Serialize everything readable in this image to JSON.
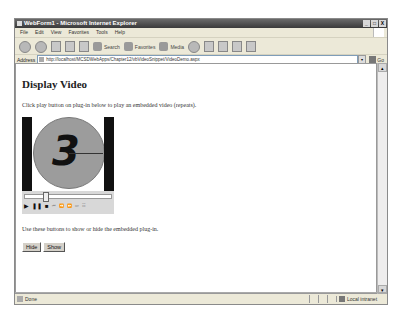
{
  "window": {
    "title": "WebForm1 - Microsoft Internet Explorer",
    "controls": [
      "_",
      "□",
      "X"
    ]
  },
  "menu": [
    "File",
    "Edit",
    "View",
    "Favorites",
    "Tools",
    "Help"
  ],
  "toolbar": {
    "back_label": "Back",
    "search_label": "Search",
    "favorites_label": "Favorites",
    "media_label": "Media"
  },
  "address": {
    "label": "Address",
    "url": "http://localhost/MCSDWebApps/Chapter12/vbVideoSnippet/VideoDemo.aspx",
    "go_label": "Go"
  },
  "page": {
    "heading": "Display Video",
    "intro": "Click play button on plug-in below to play an embedded video (repeats).",
    "video_frame_number": "3",
    "instructions": "Use these buttons to show or hide the embedded plug-in.",
    "buttons": {
      "hide": "Hide",
      "show": "Show"
    }
  },
  "player": {
    "controls": [
      "▶",
      "❚❚",
      "■",
      "⏮",
      "⏪",
      "⏩",
      "⏭",
      "☷"
    ]
  },
  "status": {
    "text": "Done",
    "zone": "Local intranet"
  }
}
